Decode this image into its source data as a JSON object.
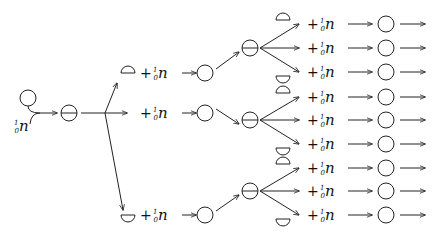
{
  "neutron_label": {
    "symbol": "n",
    "mass": "1",
    "charge": "0"
  },
  "plus": "+",
  "colors": {
    "stroke": "#222222",
    "background": "#ffffff"
  },
  "initial": {
    "nucleus": {
      "x": 28,
      "y": 98,
      "r": 8
    },
    "neutron_text": {
      "x": 14,
      "y": 131
    },
    "split": {
      "x": 69,
      "y": 113,
      "r": 8
    }
  },
  "branch_point": {
    "x": 105,
    "y": 113
  },
  "level1": [
    {
      "y": 73,
      "half": "up"
    },
    {
      "y": 113,
      "half": "none"
    },
    {
      "y": 215,
      "half": "down"
    }
  ],
  "level2_splits": [
    {
      "x": 250,
      "y": 48
    },
    {
      "x": 250,
      "y": 120
    },
    {
      "x": 250,
      "y": 191
    }
  ],
  "level3_rows": [
    {
      "y": 24,
      "half": "up"
    },
    {
      "y": 48,
      "half": "none"
    },
    {
      "y": 72,
      "half": "down"
    },
    {
      "y": 97,
      "half": "up"
    },
    {
      "y": 120,
      "half": "none"
    },
    {
      "y": 144,
      "half": "down"
    },
    {
      "y": 168,
      "half": "up"
    },
    {
      "y": 191,
      "half": "none"
    },
    {
      "y": 215,
      "half": "down"
    }
  ]
}
